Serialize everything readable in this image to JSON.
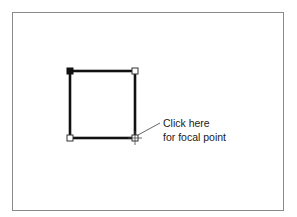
{
  "diagram": {
    "shape": "square",
    "corners": {
      "top_left": {
        "x": 70,
        "y": 71,
        "handle": "filled"
      },
      "top_right": {
        "x": 135,
        "y": 71,
        "handle": "hollow"
      },
      "bottom_right": {
        "x": 135,
        "y": 138,
        "handle": "hollow-focal"
      },
      "bottom_left": {
        "x": 70,
        "y": 138,
        "handle": "hollow"
      }
    },
    "stroke_color": "#111111",
    "frame_color": "#8a8a8a"
  },
  "callout": {
    "line1": "Click here",
    "line2": "for focal point",
    "icon": "crosshair-cursor-icon"
  }
}
